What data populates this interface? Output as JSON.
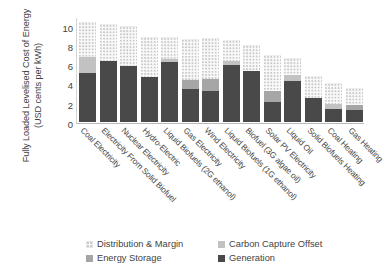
{
  "chart_data": {
    "type": "bar",
    "stacked": true,
    "title": "",
    "xlabel": "",
    "ylabel": "Fully Loaded Levelised Cost of Energy (USD cents per kWh)",
    "ylim": [
      0,
      11
    ],
    "yticks": [
      0,
      2,
      4,
      6,
      8,
      10
    ],
    "grid": false,
    "legend_position": "bottom",
    "categories": [
      "Coal Electricity",
      "Electricity From Solid Biofuel",
      "Nuclear Electricity",
      "Hydro-Electric",
      "Liquid Biofuels (2G ethanol)",
      "Gas Electricity",
      "Wind Electricity",
      "Liquid Biofuels (1G ethanol)",
      "Biofuel (3G algae oil)",
      "Solar PV Electricity",
      "Liquid Oil",
      "Solid Biofuels Heating",
      "Coal Heating",
      "Gas Heating"
    ],
    "series": [
      {
        "name": "Generation",
        "color": "#494949",
        "values": [
          5.1,
          6.3,
          5.85,
          4.7,
          6.25,
          3.4,
          3.2,
          5.9,
          5.25,
          2.1,
          4.3,
          2.5,
          1.3,
          1.2
        ]
      },
      {
        "name": "Energy Storage",
        "color": "#a6a6a6",
        "values": [
          0,
          0,
          0,
          0,
          0,
          1.0,
          1.25,
          0,
          0,
          1.1,
          0,
          0,
          0,
          0.6
        ]
      },
      {
        "name": "Carbon Capture Offset",
        "color": "#c2c2c2",
        "values": [
          1.6,
          0,
          0,
          0,
          0.25,
          0,
          0,
          0.4,
          0,
          0,
          0.6,
          0,
          0.55,
          0
        ]
      },
      {
        "name": "Distribution & Margin",
        "color": "#f0f0f0",
        "values": [
          3.7,
          3.9,
          4.15,
          4.1,
          2.3,
          4.25,
          4.25,
          2.25,
          2.75,
          3.8,
          1.7,
          2.3,
          2.15,
          1.7
        ]
      }
    ],
    "totals": [
      10.4,
      10.2,
      10.0,
      8.8,
      8.8,
      8.65,
      8.7,
      8.55,
      8.0,
      7.0,
      6.6,
      4.8,
      4.0,
      3.5
    ]
  },
  "legend": {
    "items": [
      {
        "label": "Distribution & Margin",
        "swatch": "distribution"
      },
      {
        "label": "Carbon Capture Offset",
        "swatch": "capture"
      },
      {
        "label": "Energy Storage",
        "swatch": "storage"
      },
      {
        "label": "Generation",
        "swatch": "generation"
      }
    ]
  },
  "axis": {
    "y_title_line1": "Fully Loaded Levelised Cost of Energy",
    "y_title_line2": "(USD cents per kWh)"
  }
}
